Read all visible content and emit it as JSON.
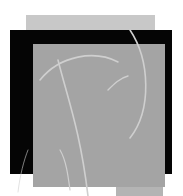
{
  "artwork": {
    "background_color": "#ffffff",
    "layers": [
      {
        "name": "back-square",
        "color": "#c8c8c8"
      },
      {
        "name": "black-square",
        "color": "#050505"
      },
      {
        "name": "front-square",
        "color": "#a4a4a4"
      },
      {
        "name": "bottom-strip",
        "color": "#b4b4b4"
      }
    ],
    "curve_color": "#cfcfcf"
  }
}
